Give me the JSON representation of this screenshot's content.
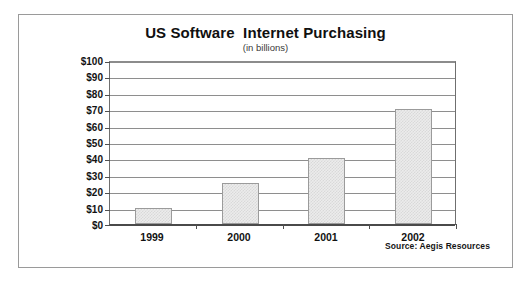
{
  "chart_data": {
    "type": "bar",
    "title": "US Software  Internet Purchasing",
    "subtitle": "(in billions)",
    "xlabel": "",
    "ylabel": "",
    "categories": [
      "1999",
      "2000",
      "2001",
      "2002"
    ],
    "values": [
      10,
      25,
      40,
      70
    ],
    "ylim": [
      0,
      100
    ],
    "ytick_step": 10,
    "ytick_labels": [
      "$0",
      "$10",
      "$20",
      "$30",
      "$40",
      "$50",
      "$60",
      "$70",
      "$80",
      "$90",
      "$100"
    ],
    "ytick_values": [
      0,
      10,
      20,
      30,
      40,
      50,
      60,
      70,
      80,
      90,
      100
    ],
    "grid": true,
    "grid_axis": "y",
    "legend": false,
    "legend_position": "none",
    "annotations": [
      {
        "name": "source-note",
        "text": "Source: Aegis Resources"
      }
    ],
    "series": [
      {
        "name": "US Software Internet Purchasing",
        "values": [
          10,
          25,
          40,
          70
        ]
      }
    ],
    "colors": {
      "bar_fill": "#ececec",
      "bar_pattern": "#d9d9d9",
      "bar_border": "#9b9b9b",
      "gridline": "#8e8e8e",
      "axis": "#4a4a4a",
      "frame": "#9a9a9a",
      "title_text": "#101010",
      "label_text": "#121212"
    }
  }
}
